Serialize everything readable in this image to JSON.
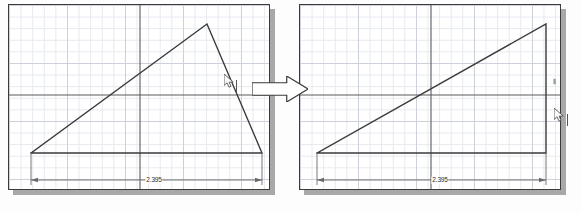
{
  "scene": {
    "title": "CAD sketch dimension edit before-and-after",
    "background_color": "#fdfdfd"
  },
  "colors": {
    "panel_border": "#3b3b3b",
    "panel_shadow": "#a8a8a8",
    "panel_fill": "#ffffff",
    "grid_minor": "#e6e9ef",
    "grid_major": "#c9cdd6",
    "axis": "#5a5a5a",
    "geometry_line": "#3a3a3a",
    "dimension_line": "#6a6a6a",
    "dimension_text": "#2b2b2b",
    "cursor": "#555555",
    "arrow_fill": "#ffffff",
    "arrow_stroke": "#3b3b3b"
  },
  "panels": [
    {
      "id": "before",
      "name": "sketch-panel-before",
      "x": 8,
      "y": 4,
      "width": 262,
      "height": 186,
      "shadow_offset": 5,
      "grid_minor_step": 11.6,
      "grid_major_step": 58,
      "axis_x_at": 90,
      "axis_y_at": 131,
      "geometry": {
        "type": "open-polyline-triangle",
        "points": [
          [
            22,
            148
          ],
          [
            198,
            19
          ],
          [
            253,
            148
          ],
          [
            22,
            148
          ]
        ],
        "description": "Triangular sketch with apex raised above baseline"
      },
      "dimension": {
        "name": "horizontal-dimension-2395",
        "label": "2.395",
        "y": 175,
        "x_start": 22,
        "x_end": 253,
        "ext_top": 148,
        "label_x": 145
      }
    },
    {
      "id": "after",
      "name": "sketch-panel-after",
      "x": 299,
      "y": 4,
      "width": 262,
      "height": 186,
      "shadow_offset": 5,
      "grid_minor_step": 11.6,
      "grid_major_step": 58,
      "axis_x_at": 90,
      "axis_y_at": 131,
      "geometry": {
        "type": "open-polyline-right-triangle",
        "points": [
          [
            17,
            148
          ],
          [
            246,
            19
          ],
          [
            246,
            148
          ],
          [
            17,
            148
          ]
        ],
        "description": "Right triangle after the slanted edge was made vertical"
      },
      "dimension": {
        "name": "horizontal-dimension-2395",
        "label": "2.395",
        "y": 175,
        "x_start": 17,
        "x_end": 246,
        "ext_top": 148,
        "label_x": 140
      }
    }
  ],
  "connector": {
    "name": "transition-arrow",
    "label": "",
    "x": 252,
    "y": 76,
    "width": 56,
    "height": 26
  },
  "cursors": [
    {
      "name": "mouse-cursor-before",
      "panel": "before",
      "x": 224,
      "y": 74,
      "caret_x": 236,
      "caret_y": 80,
      "caret_height": 12
    },
    {
      "name": "mouse-cursor-after",
      "panel": "after",
      "x": 554,
      "y": 108,
      "caret_x": 567,
      "caret_y": 114,
      "caret_height": 12
    }
  ],
  "markers": [
    {
      "name": "vertical-constraint-glyph",
      "panel": "after",
      "glyph": "⦀",
      "x": 553,
      "y": 78
    }
  ],
  "dimension_values": {
    "before_label": "2.395",
    "after_label": "2.395"
  }
}
